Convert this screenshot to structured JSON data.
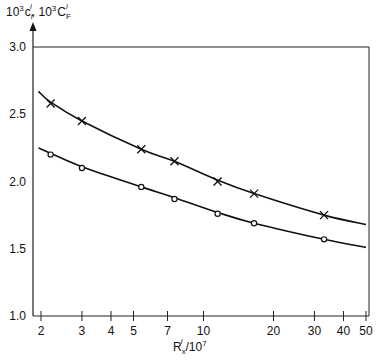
{
  "chart_data": {
    "type": "line",
    "title": "",
    "ylabel": "10³c_f^i, 10³C_F^i",
    "ylabel_parts": {
      "a_base": "10",
      "a_exp": "3",
      "a_sym": "c",
      "a_sub": "f",
      "a_sup": "i",
      "sep": ", ",
      "b_base": "10",
      "b_exp": "3",
      "b_sym": "C",
      "b_sub": "F",
      "b_sup": "i"
    },
    "xlabel": "R_x^i/10^7",
    "xlabel_parts": {
      "sym": "R",
      "sub": "x",
      "sup": "i",
      "div": "/10",
      "exp": "7"
    },
    "xscale": "log",
    "xlim": [
      1.95,
      50
    ],
    "ylim": [
      1.0,
      3.0
    ],
    "x_ticks": [
      2,
      3,
      4,
      5,
      7,
      10,
      20,
      30,
      40,
      50
    ],
    "y_ticks": [
      1.0,
      1.5,
      2.0,
      2.5,
      3.0
    ],
    "y_tick_labels": [
      "1.0",
      "1.5",
      "2.0",
      "2.5",
      "3.0"
    ],
    "grid": false,
    "legend": null,
    "series": [
      {
        "name": "10³c_f^i (upper, × markers)",
        "marker": "x",
        "x": [
          2.2,
          3.0,
          5.4,
          7.5,
          11.5,
          16.5,
          33
        ],
        "values": [
          2.58,
          2.45,
          2.24,
          2.15,
          2.0,
          1.91,
          1.75
        ],
        "curve": {
          "x": [
            1.95,
            2.2,
            3.0,
            5.4,
            7.5,
            11.5,
            16.5,
            33,
            50
          ],
          "y": [
            2.67,
            2.59,
            2.45,
            2.24,
            2.15,
            2.01,
            1.91,
            1.75,
            1.68
          ]
        }
      },
      {
        "name": "10³C_F^i (lower, o markers)",
        "marker": "o",
        "x": [
          2.2,
          3.0,
          5.4,
          7.5,
          11.5,
          16.5,
          33
        ],
        "values": [
          2.2,
          2.1,
          1.96,
          1.87,
          1.76,
          1.69,
          1.57
        ],
        "curve": {
          "x": [
            1.95,
            2.2,
            3.0,
            5.4,
            7.5,
            11.5,
            16.5,
            33,
            50
          ],
          "y": [
            2.25,
            2.21,
            2.11,
            1.96,
            1.88,
            1.77,
            1.69,
            1.57,
            1.51
          ]
        }
      }
    ]
  },
  "colors": {
    "line": "#111111",
    "background": "#ffffff",
    "frame": "#333333"
  }
}
